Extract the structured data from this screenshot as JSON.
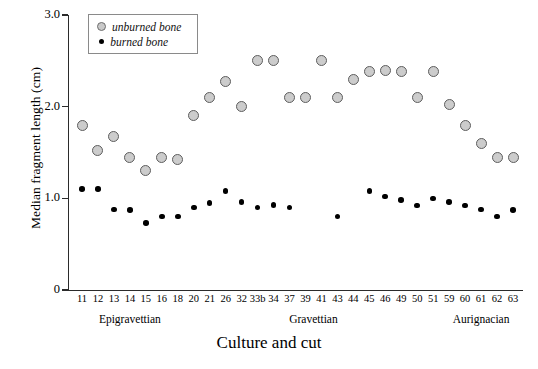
{
  "chart_data": {
    "type": "scatter",
    "title": "",
    "xlabel": "Culture and cut",
    "ylabel": "Median fragment length (cm)",
    "ylim": [
      0,
      3.0
    ],
    "yticks": [
      "0",
      "1.0",
      "2.0",
      "3.0"
    ],
    "ytick_values": [
      0,
      1.0,
      2.0,
      3.0
    ],
    "grid": false,
    "legend_position": "top-left",
    "categories": [
      "11",
      "12",
      "13",
      "14",
      "15",
      "16",
      "18",
      "20",
      "21",
      "26",
      "32",
      "33b",
      "34",
      "37",
      "39",
      "41",
      "43",
      "44",
      "45",
      "46",
      "49",
      "50",
      "51",
      "59",
      "60",
      "61",
      "62",
      "63"
    ],
    "groups": [
      {
        "label": "Epigravettian",
        "start": 0,
        "end": 6
      },
      {
        "label": "Gravettian",
        "start": 7,
        "end": 22
      },
      {
        "label": "Aurignacian",
        "start": 23,
        "end": 27
      }
    ],
    "series": [
      {
        "name": "unburned bone",
        "color": "#cccccc",
        "edge_color": "#5e5e5e",
        "marker": "circle-large",
        "values": [
          1.8,
          1.52,
          1.67,
          1.45,
          1.3,
          1.45,
          1.42,
          1.9,
          2.1,
          2.27,
          2.0,
          2.5,
          2.5,
          2.1,
          2.1,
          2.5,
          2.1,
          2.3,
          2.38,
          2.4,
          2.38,
          2.1,
          2.38,
          2.02,
          1.8,
          1.6,
          1.45,
          1.45
        ]
      },
      {
        "name": "burned bone",
        "color": "#000000",
        "marker": "circle-small",
        "values": [
          1.1,
          1.1,
          0.88,
          0.87,
          0.73,
          0.8,
          0.8,
          0.9,
          0.95,
          1.08,
          0.96,
          0.9,
          0.93,
          0.9,
          null,
          null,
          0.8,
          null,
          1.08,
          1.02,
          0.98,
          0.92,
          1.0,
          0.96,
          0.92,
          0.88,
          0.8,
          0.87
        ]
      }
    ]
  },
  "legend": {
    "items": [
      {
        "label": "unburned bone",
        "swatch": "gray-circle-icon"
      },
      {
        "label": "burned bone",
        "swatch": "black-dot-icon"
      }
    ]
  },
  "axis": {
    "x_title": "Culture and cut",
    "y_title": "Median fragment length (cm)"
  }
}
